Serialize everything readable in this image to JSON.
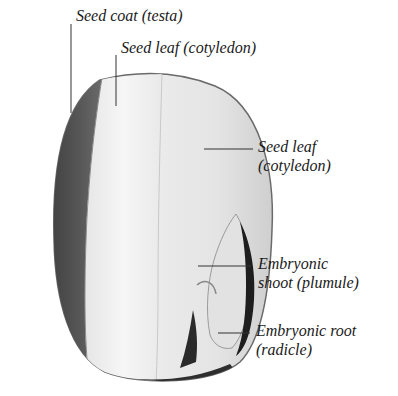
{
  "diagram": {
    "colors": {
      "background": "#ffffff",
      "seed_coat": "#4a4a4a",
      "seed_coat_dark": "#2e2e2e",
      "cotyledon_light": "#f2f2f2",
      "cotyledon_mid": "#dcdcdc",
      "embryo_dark": "#1e1e1e",
      "leader_line": "#333333",
      "text": "#1a1a1a"
    },
    "labels": [
      {
        "id": "seed-coat",
        "lines": [
          "Seed coat (testa)"
        ]
      },
      {
        "id": "seed-leaf-top",
        "lines": [
          "Seed leaf (cotyledon)"
        ]
      },
      {
        "id": "seed-leaf-right",
        "lines": [
          "Seed leaf",
          "(cotyledon)"
        ]
      },
      {
        "id": "embryonic-shoot",
        "lines": [
          "Embryonic",
          "shoot (plumule)"
        ]
      },
      {
        "id": "embryonic-root",
        "lines": [
          "Embryonic root",
          "(radicle)"
        ]
      }
    ]
  }
}
